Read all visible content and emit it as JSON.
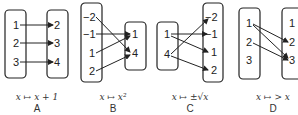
{
  "diagrams": [
    {
      "id": "A",
      "label": "A",
      "caption": "x ↦ x + 1",
      "domain": [
        "1",
        "2",
        "3"
      ],
      "codomain": [
        "2",
        "3",
        "4"
      ],
      "mappings": [
        [
          "1",
          "2"
        ],
        [
          "2",
          "3"
        ],
        [
          "3",
          "4"
        ]
      ]
    },
    {
      "id": "B",
      "label": "B",
      "caption": "x ↦ x²",
      "domain": [
        "−2",
        "−1",
        "1",
        "2"
      ],
      "codomain": [
        "1",
        "4"
      ],
      "mappings": [
        [
          "−2",
          "4"
        ],
        [
          "−1",
          "1"
        ],
        [
          "1",
          "1"
        ],
        [
          "2",
          "4"
        ]
      ]
    },
    {
      "id": "C",
      "label": "C",
      "caption": "x ↦ ±√x",
      "domain": [
        "1",
        "4"
      ],
      "codomain": [
        "−2",
        "−1",
        "1",
        "2"
      ],
      "mappings": [
        [
          "1",
          "−1"
        ],
        [
          "1",
          "1"
        ],
        [
          "4",
          "−2"
        ],
        [
          "4",
          "2"
        ]
      ]
    },
    {
      "id": "D",
      "label": "D",
      "caption": "x ↦ > x",
      "domain": [
        "1",
        "2",
        "3"
      ],
      "codomain": [
        "1",
        "2",
        "3"
      ],
      "mappings": [
        [
          "1",
          "2"
        ],
        [
          "1",
          "3"
        ],
        [
          "2",
          "3"
        ]
      ]
    }
  ]
}
